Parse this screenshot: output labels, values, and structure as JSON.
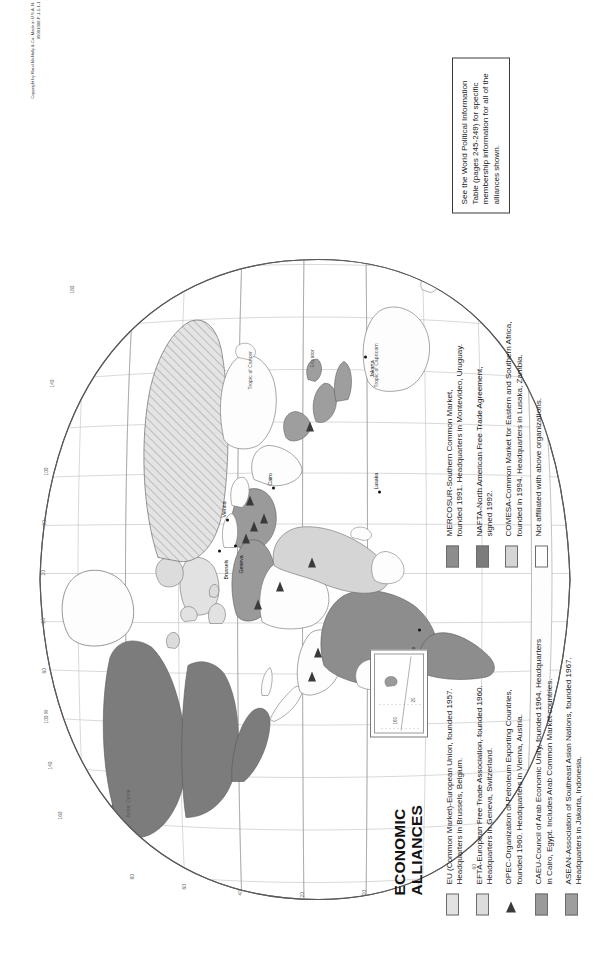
{
  "map": {
    "title_line1": "ECONOMIC",
    "title_line2": "ALLIANCES",
    "copyright": "Copyright by Rand McNally & Co.  Made in U.S.A.  N-05001000-P-1-1-1-1",
    "projection_note": "",
    "colors": {
      "eu": "#e2e2e2",
      "efta": "#dcdcdc",
      "opec_marker": "#3a3a3a",
      "caeu": "#9a9a9a",
      "asean": "#9e9e9e",
      "mercosur": "#8d8d8d",
      "nafta": "#7c7c7c",
      "comesa": "#d5d5d5",
      "unaffiliated": "#fdfdfd",
      "ocean": "#ffffff",
      "border": "#6c6c6c"
    }
  },
  "legend": {
    "left_column": [
      {
        "key": "eu",
        "swatch": "#e2e2e2",
        "line1": "EU (Common Market)-European Union, founded 1957.",
        "line2": "Headquarters in Brussels, Belgium."
      },
      {
        "key": "efta",
        "swatch": "#dcdcdc",
        "line1": "EFTA-European Free Trade Association, founded 1960.",
        "line2": "Headquarters in Geneva, Switzerland."
      },
      {
        "key": "opec",
        "swatch": "triangle",
        "line1": "OPEC-Organization of Petroleum Exporting Countries,",
        "line2": "founded 1960.  Headquarters in Vienna, Austria."
      },
      {
        "key": "caeu",
        "swatch": "#9a9a9a",
        "line1": "CAEU-Council of Arab Economic Unity, founded 1964.  Headquarters",
        "line2": "in Cairo, Egypt.  Includes Arab Common Market countries."
      },
      {
        "key": "asean",
        "swatch": "#9e9e9e",
        "line1": "ASEAN-Association of Southeast Asian Nations, founded 1967.",
        "line2": "Headquarters in Jakarta, Indonesia."
      }
    ],
    "right_column": [
      {
        "key": "mercosur",
        "swatch": "#8d8d8d",
        "line1": "MERCOSUR-Southern Common Market,",
        "line2": "founded 1991. Headquarters in Montevideo, Uruguay."
      },
      {
        "key": "nafta",
        "swatch": "#7c7c7c",
        "line1": "NAFTA-North American Free Trade Agreement,",
        "line2": "signed 1992."
      },
      {
        "key": "comesa",
        "swatch": "#d5d5d5",
        "line1": "COMESA-Common Market for Eastern and Southern Africa,",
        "line2": "founded in 1994. Headquarters in Lusaka, Zambia."
      },
      {
        "key": "unaffiliated",
        "swatch": "#fdfdfd",
        "line1": "Not affiliated with above organizations.",
        "line2": ""
      }
    ]
  },
  "note_box": {
    "line1": "See the World Political",
    "line2": "Information Table (pages",
    "line3": "245-249) for specific",
    "line4": "membership information for",
    "line5": "all of the alliances shown."
  },
  "cities": [
    {
      "name": "Brussels",
      "x": 309,
      "y": 184
    },
    {
      "name": "Geneva",
      "x": 316,
      "y": 201
    },
    {
      "name": "Vienna",
      "x": 340,
      "y": 192
    },
    {
      "name": "Cairo",
      "x": 372,
      "y": 239
    },
    {
      "name": "Lusaka",
      "x": 368,
      "y": 345
    },
    {
      "name": "Jakarta",
      "x": 503,
      "y": 330
    },
    {
      "name": "Montevideo",
      "x": 214,
      "y": 383
    }
  ],
  "graticule_labels": {
    "longitudes": [
      "160",
      "140",
      "120",
      "100 W",
      "80",
      "60",
      "40",
      "20",
      "0",
      "20",
      "40",
      "60",
      "80",
      "100",
      "120",
      "140",
      "160",
      "180"
    ],
    "latitudes": [
      "80",
      "60",
      "40",
      "20",
      "0",
      "20",
      "40",
      "60"
    ]
  },
  "annotations": {
    "arctic_circle": "Arctic Circle",
    "tropic_cancer": "Tropic of Cancer",
    "equator": "Equator",
    "tropic_capricorn": "Tropic of Capricorn"
  },
  "inset": {
    "label_lat": "160",
    "label_lon": "20"
  }
}
